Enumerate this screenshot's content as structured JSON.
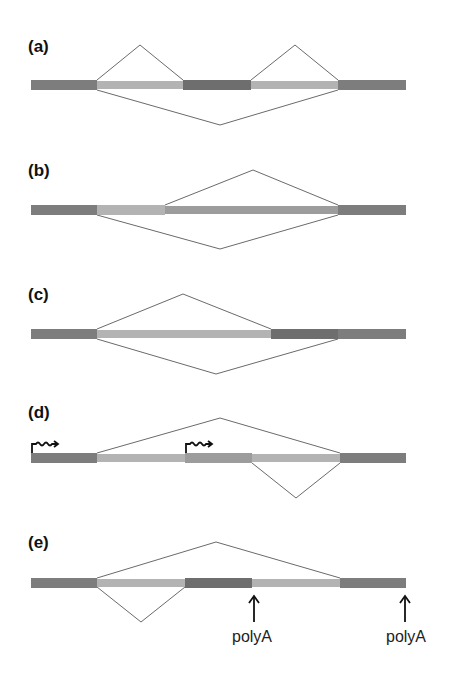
{
  "colors": {
    "constitutive_exon": "#7d7d7d",
    "alternative_exon_light": "#b3b3b3",
    "alternative_exon_medium": "#9c9c9c",
    "alternative_exon_dark": "#6e6e6e",
    "junction_line": "#6a6a6a",
    "arrow": "#111111"
  },
  "panels": [
    {
      "id": "a",
      "label": "(a)",
      "description": "cassette exon skipping"
    },
    {
      "id": "b",
      "label": "(b)",
      "description": "alternative 5' splice site"
    },
    {
      "id": "c",
      "label": "(c)",
      "description": "alternative 3' splice site"
    },
    {
      "id": "d",
      "label": "(d)",
      "description": "alternative promoters",
      "promoter_icon": "promoter-arrow-icon"
    },
    {
      "id": "e",
      "label": "(e)",
      "description": "alternative polyadenylation",
      "polyA_labels": [
        "polyA",
        "polyA"
      ]
    }
  ]
}
